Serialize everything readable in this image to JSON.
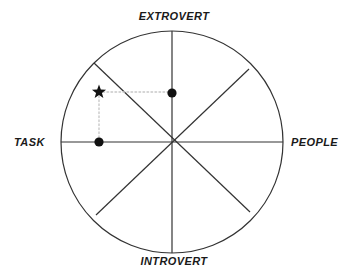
{
  "diagram": {
    "background_color": "#ffffff",
    "stroke_color": "#333333",
    "guide_color": "#c8c8c8",
    "marker_color": "#111111",
    "labels": {
      "top": "EXTROVERT",
      "bottom": "INTROVERT",
      "left": "TASK",
      "right": "PEOPLE"
    },
    "circle": {
      "center_x": 172,
      "center_y": 142,
      "radius": 111
    },
    "spokes": [
      {
        "name": "vertical-axis",
        "x1": 172,
        "y1": 31,
        "x2": 172,
        "y2": 253
      },
      {
        "name": "horizontal-axis",
        "x1": 61,
        "y1": 142,
        "x2": 283,
        "y2": 142
      },
      {
        "name": "diagonal-nw-se",
        "x1": 94,
        "y1": 63,
        "x2": 250,
        "y2": 212
      },
      {
        "name": "diagonal-ne-sw",
        "x1": 249,
        "y1": 69,
        "x2": 96,
        "y2": 215
      }
    ],
    "markers": [
      {
        "name": "star-marker",
        "shape": "star",
        "x": 99,
        "y": 92
      },
      {
        "name": "dot-marker-extrovert",
        "shape": "dot",
        "x": 172,
        "y": 93
      },
      {
        "name": "dot-marker-task",
        "shape": "dot",
        "x": 99,
        "y": 142
      }
    ],
    "guides": [
      {
        "name": "guide-horizontal",
        "x1": 99,
        "y1": 92,
        "x2": 172,
        "y2": 92
      },
      {
        "name": "guide-vertical",
        "x1": 99,
        "y1": 92,
        "x2": 99,
        "y2": 142
      }
    ]
  },
  "chart_data": {
    "type": "scatter",
    "xlabel": "TASK ↔ PEOPLE",
    "ylabel": "INTROVERT ↔ EXTROVERT",
    "xlim": [
      -1,
      1
    ],
    "ylim": [
      -1,
      1
    ],
    "grid": false,
    "legend": "none",
    "axis_labels": {
      "x_negative": "TASK",
      "x_positive": "PEOPLE",
      "y_positive": "EXTROVERT",
      "y_negative": "INTROVERT"
    },
    "segments": 8,
    "points": [
      {
        "label": "plotted style",
        "marker": "star",
        "x": -0.66,
        "y": 0.45
      },
      {
        "label": "extrovert score",
        "marker": "dot",
        "x": 0.0,
        "y": 0.44
      },
      {
        "label": "task score",
        "marker": "dot",
        "x": -0.66,
        "y": 0.0
      }
    ],
    "connectors": [
      {
        "from": "plotted style",
        "to": "extrovert score",
        "style": "dotted"
      },
      {
        "from": "plotted style",
        "to": "task score",
        "style": "dotted"
      }
    ]
  }
}
